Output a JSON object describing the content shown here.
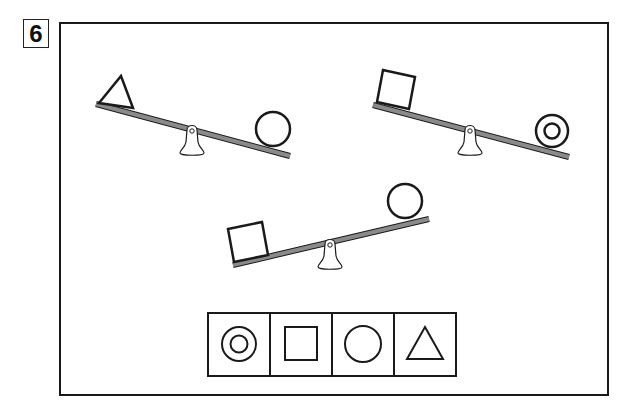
{
  "question": {
    "number": "6"
  },
  "colors": {
    "stroke": "#1a1a1a",
    "beam": "#8a8a8a",
    "background": "#ffffff"
  },
  "seesaws": [
    {
      "id": "seesaw-1",
      "heavy_side": "left",
      "left_shape": "triangle",
      "right_shape": "circle"
    },
    {
      "id": "seesaw-2",
      "heavy_side": "left",
      "left_shape": "square",
      "right_shape": "double-circle"
    },
    {
      "id": "seesaw-3",
      "heavy_side": "left",
      "left_shape": "square",
      "right_shape": "circle"
    }
  ],
  "answer_choices": [
    {
      "index": 1,
      "shape": "double-circle"
    },
    {
      "index": 2,
      "shape": "square"
    },
    {
      "index": 3,
      "shape": "circle"
    },
    {
      "index": 4,
      "shape": "triangle"
    }
  ]
}
